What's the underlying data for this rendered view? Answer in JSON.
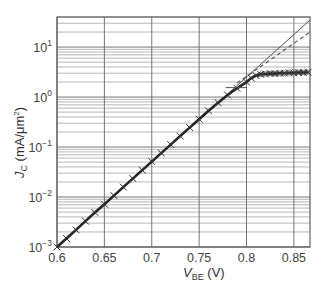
{
  "chart_data": {
    "type": "line",
    "title": "",
    "xlabel": "V_BE (V)",
    "ylabel": "J_C (mA/μm²)",
    "xlabel_main": "V",
    "xlabel_sub": "BE",
    "xlabel_unit": " (V)",
    "ylabel_main": "J",
    "ylabel_sub": "C",
    "ylabel_unit": " (mA/μm",
    "ylabel_sup": "2",
    "ylabel_close": ")",
    "xlim": [
      0.6,
      0.867
    ],
    "ylim": [
      0.001,
      40
    ],
    "yscale": "log",
    "grid": true,
    "x_ticks": [
      "0.6",
      "0.65",
      "0.7",
      "0.75",
      "0.8",
      "0.85"
    ],
    "x_tick_values": [
      0.6,
      0.65,
      0.7,
      0.75,
      0.8,
      0.85
    ],
    "y_ticks": [
      {
        "base": "10",
        "exp": "1",
        "value": 10
      },
      {
        "base": "10",
        "exp": "0",
        "value": 1
      },
      {
        "base": "10",
        "exp": "−1",
        "value": 0.1
      },
      {
        "base": "10",
        "exp": "−2",
        "value": 0.01
      },
      {
        "base": "10",
        "exp": "−3",
        "value": 0.001
      }
    ],
    "series": [
      {
        "name": "ideal exponential (solid)",
        "style": "solid-thin",
        "x": [
          0.6,
          0.867
        ],
        "y": [
          0.001,
          34.7
        ]
      },
      {
        "name": "dashed extrapolation",
        "style": "dashed",
        "x": [
          0.79,
          0.867
        ],
        "y": [
          1.9,
          20
        ]
      },
      {
        "name": "measured data (x markers)",
        "style": "thick-with-x-markers",
        "x": [
          0.6,
          0.61,
          0.62,
          0.63,
          0.64,
          0.65,
          0.66,
          0.67,
          0.68,
          0.69,
          0.7,
          0.71,
          0.72,
          0.73,
          0.74,
          0.75,
          0.76,
          0.77,
          0.78,
          0.79,
          0.8,
          0.805,
          0.81,
          0.815,
          0.82,
          0.825,
          0.83,
          0.835,
          0.84,
          0.845,
          0.85,
          0.855,
          0.86,
          0.865
        ],
        "y": [
          0.001,
          0.00148,
          0.0022,
          0.0033,
          0.0049,
          0.0072,
          0.0107,
          0.0158,
          0.0234,
          0.0346,
          0.0512,
          0.0758,
          0.112,
          0.166,
          0.245,
          0.36,
          0.53,
          0.77,
          1.1,
          1.5,
          2.0,
          2.4,
          2.7,
          2.85,
          2.9,
          2.95,
          2.95,
          3.0,
          3.0,
          3.05,
          3.05,
          3.1,
          3.1,
          3.15
        ]
      },
      {
        "name": "short reference mark",
        "style": "solid-thin",
        "x": [
          0.778,
          0.8
        ],
        "y": [
          1.55,
          1.55
        ]
      }
    ]
  }
}
